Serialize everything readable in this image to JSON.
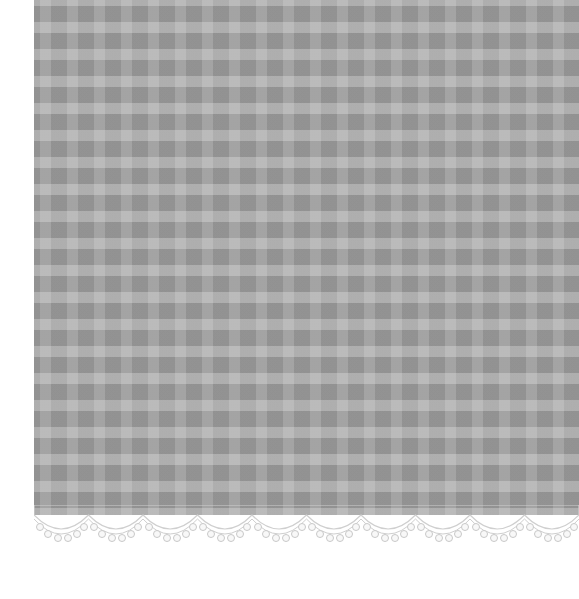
{
  "scene": {
    "description": "Gray gingham patterned paper with a scalloped white lace border at the bottom",
    "colors": {
      "background": "#ffffff",
      "paper_base": "#a9a9a9",
      "dark_square": "#999999",
      "light_band": "#b4b4b4",
      "lace": "#f2f2f2",
      "lace_outline": "#cfcfcf"
    },
    "pattern": {
      "type": "gingham",
      "period_px": 27
    },
    "lace_scallops": 10
  }
}
